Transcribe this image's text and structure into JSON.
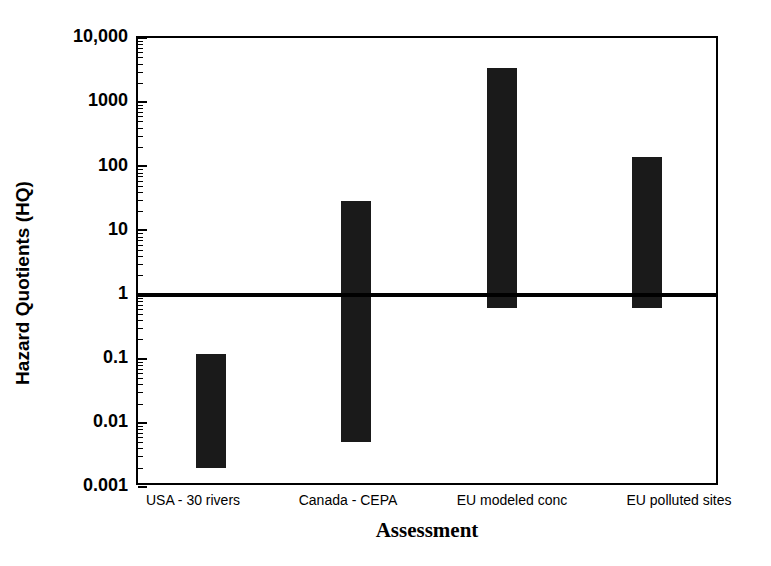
{
  "chart_data": {
    "type": "bar",
    "title": "",
    "xlabel": "Assessment",
    "ylabel": "Hazard Quotients (HQ)",
    "yscale": "log",
    "ylim": [
      0.001,
      10000
    ],
    "grid": false,
    "legend": null,
    "ytick_labels": [
      "10,000",
      "1000",
      "100",
      "10",
      "1",
      "0.1",
      "0.01",
      "0.001"
    ],
    "ytick_values": [
      10000,
      1000,
      100,
      10,
      1,
      0.1,
      0.01,
      0.001
    ],
    "categories": [
      "USA - 30 rivers",
      "Canada - CEPA",
      "EU modeled conc",
      "EU polluted sites"
    ],
    "ranges": [
      {
        "category": "USA - 30 rivers",
        "low": 0.002,
        "high": 0.12
      },
      {
        "category": "Canada - CEPA",
        "low": 0.005,
        "high": 29
      },
      {
        "category": "EU modeled conc",
        "low": 0.62,
        "high": 3400
      },
      {
        "category": "EU polluted sites",
        "low": 0.62,
        "high": 140
      }
    ],
    "reference_line": {
      "label": "HQ = 1",
      "value": 1
    },
    "bar_color": "#1a1a1a",
    "axis_color": "#000000"
  }
}
